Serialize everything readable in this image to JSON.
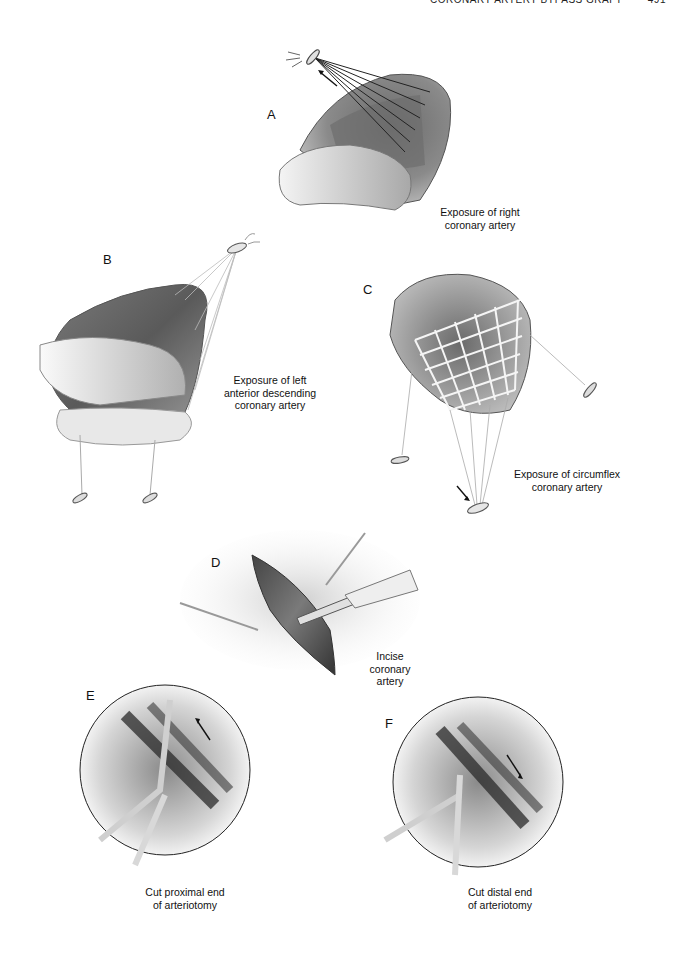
{
  "page": {
    "running_head": "CORONARY ARTERY BYPASS GRAFT",
    "page_number": "491"
  },
  "figures": [
    {
      "letter": "A",
      "caption": "Exposure of right coronary artery",
      "caption_lines": [
        "Exposure of right",
        "coronary artery"
      ]
    },
    {
      "letter": "B",
      "caption": "Exposure of left anterior descending coronary artery",
      "caption_lines": [
        "Exposure of left",
        "anterior descending",
        "coronary artery"
      ]
    },
    {
      "letter": "C",
      "caption": "Exposure of circumflex coronary artery",
      "caption_lines": [
        "Exposure of circumflex",
        "coronary artery"
      ]
    },
    {
      "letter": "D",
      "caption": "Incise coronary artery",
      "caption_lines": [
        "Incise",
        "coronary",
        "artery"
      ]
    },
    {
      "letter": "E",
      "caption": "Cut proximal end of arteriotomy",
      "caption_lines": [
        "Cut proximal end",
        "of arteriotomy"
      ]
    },
    {
      "letter": "F",
      "caption": "Cut distal end of arteriotomy",
      "caption_lines": [
        "Cut distal end",
        "of arteriotomy"
      ]
    }
  ],
  "colors": {
    "ink": "#1a1a1a",
    "tissue_dark": "#5a5a5a",
    "tissue_mid": "#8c8c8c",
    "tissue_light": "#d8d8d8",
    "suture": "#f2f2f2"
  }
}
